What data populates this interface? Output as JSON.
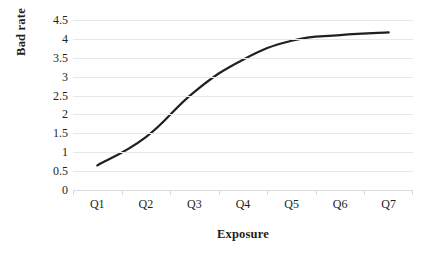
{
  "chart_data": {
    "type": "line",
    "title": "",
    "xlabel": "Exposure",
    "ylabel": "Bad rate",
    "categories": [
      "Q1",
      "Q2",
      "Q3",
      "Q4",
      "Q5",
      "Q6",
      "Q7"
    ],
    "values": [
      0.65,
      1.4,
      2.6,
      3.45,
      3.95,
      4.1,
      4.17
    ],
    "series": [
      {
        "name": "Bad rate",
        "values": [
          0.65,
          1.4,
          2.6,
          3.45,
          3.95,
          4.1,
          4.17
        ]
      }
    ],
    "ylim": [
      0,
      4.5
    ],
    "ytick_values": [
      0,
      0.5,
      1,
      1.5,
      2,
      2.5,
      3,
      3.5,
      4,
      4.5
    ],
    "ytick_labels": [
      "0",
      "0.5",
      "1",
      "1.5",
      "2",
      "2.5",
      "3",
      "3.5",
      "4",
      "4.5"
    ],
    "xtick_labels": [
      "Q1",
      "Q2",
      "Q3",
      "Q4",
      "Q5",
      "Q6",
      "Q7"
    ],
    "grid": true,
    "grid_axis": "y",
    "legend": false,
    "legend_position": "none",
    "line_color": "#231f20",
    "line_width": 2.2,
    "grid_color": "#e8e8ec",
    "background_color": "#ffffff",
    "text_color": "#231f20",
    "markers": false,
    "smooth": true
  }
}
